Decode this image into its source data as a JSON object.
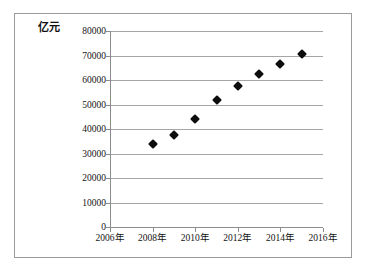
{
  "chart_data": {
    "type": "scatter",
    "title": "",
    "subtitle": "",
    "xlabel": "",
    "ylabel": "亿元",
    "y_unit_label": "亿元",
    "x": [
      2008,
      2009,
      2010,
      2011,
      2012,
      2013,
      2014,
      2015
    ],
    "values": [
      34000,
      37500,
      44000,
      52000,
      57500,
      62500,
      66500,
      70500
    ],
    "series": [
      {
        "name": "",
        "points": [
          {
            "x": 2008,
            "y": 34000
          },
          {
            "x": 2009,
            "y": 37500
          },
          {
            "x": 2010,
            "y": 44000
          },
          {
            "x": 2011,
            "y": 52000
          },
          {
            "x": 2012,
            "y": 57500
          },
          {
            "x": 2013,
            "y": 62500
          },
          {
            "x": 2014,
            "y": 66500
          },
          {
            "x": 2015,
            "y": 70500
          }
        ],
        "marker": "diamond",
        "color": "#0d0d0d"
      }
    ],
    "xlim": [
      2006,
      2016
    ],
    "ylim": [
      0,
      80000
    ],
    "y_ticks": [
      80000,
      70000,
      60000,
      50000,
      40000,
      30000,
      20000,
      10000,
      0
    ],
    "y_tick_labels": [
      "80000",
      "70000",
      "60000",
      "50000",
      "40000",
      "30000",
      "20000",
      "10000",
      "0"
    ],
    "x_ticks": [
      2006,
      2008,
      2010,
      2012,
      2014,
      2016
    ],
    "x_tick_labels": [
      "2006年",
      "2008年",
      "2010年",
      "2012年",
      "2014年",
      "2016年"
    ],
    "grid": "horizontal",
    "legend": "none",
    "colors": {
      "marker": "#0d0d0d",
      "gridline": "#a6a6a6",
      "axis": "#8d8d8d",
      "frame": "#9a9a9a",
      "text": "#141414",
      "background": "#ffffff"
    }
  }
}
